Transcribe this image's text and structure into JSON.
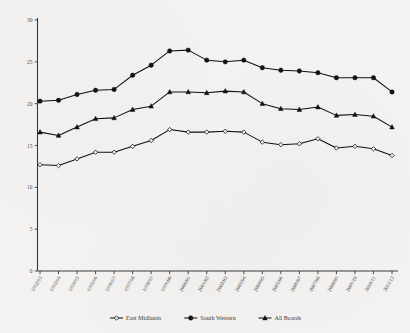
{
  "chart_data": {
    "type": "line",
    "title": "",
    "subtitle": "",
    "xlabel": "",
    "ylabel": "",
    "ylim": [
      0,
      30
    ],
    "yticks": [
      0,
      5,
      10,
      15,
      20,
      25,
      30
    ],
    "grid": false,
    "legend_position": "bottom",
    "categories": [
      "1992/93",
      "1993/94",
      "1994/95",
      "1995/96",
      "1996/97",
      "1997/98",
      "1998/99",
      "1999/00",
      "2000/01",
      "2001/02",
      "2002/03",
      "2003/04",
      "2004/05",
      "2005/06",
      "2006/07",
      "2007/08",
      "2008/09",
      "2009/10",
      "2010/11",
      "2011/12"
    ],
    "series": [
      {
        "name": "East Midlands",
        "marker": "open-diamond",
        "values": [
          12.7,
          12.6,
          13.4,
          14.2,
          14.2,
          14.9,
          15.6,
          16.9,
          16.6,
          16.6,
          16.7,
          16.6,
          15.4,
          15.1,
          15.2,
          15.8,
          14.7,
          14.9,
          14.6,
          13.8
        ]
      },
      {
        "name": "South Western",
        "marker": "filled-circle",
        "values": [
          20.3,
          20.4,
          21.1,
          21.6,
          21.7,
          23.4,
          24.6,
          26.3,
          26.4,
          25.2,
          25.0,
          25.2,
          24.3,
          24.0,
          23.9,
          23.7,
          23.1,
          23.1,
          23.1,
          21.4
        ]
      },
      {
        "name": "All Boards",
        "marker": "filled-triangle",
        "values": [
          16.6,
          16.2,
          17.2,
          18.2,
          18.3,
          19.3,
          19.7,
          21.4,
          21.4,
          21.3,
          21.5,
          21.4,
          20.0,
          19.4,
          19.3,
          19.6,
          18.6,
          18.7,
          18.5,
          17.2
        ]
      }
    ]
  },
  "legend": {
    "items": [
      {
        "label": "East Midlands"
      },
      {
        "label": "South Western"
      },
      {
        "label": "All Boards"
      }
    ]
  }
}
